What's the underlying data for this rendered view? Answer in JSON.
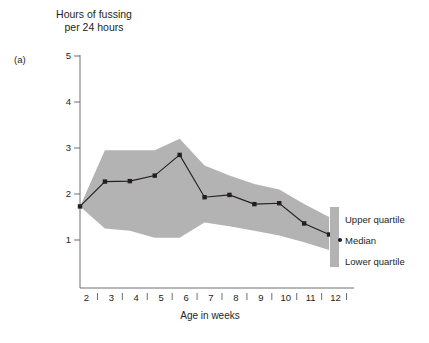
{
  "figure": {
    "panel_label": "(a)",
    "y_axis_title_line1": "Hours of fussing",
    "y_axis_title_line2": "per 24 hours",
    "x_axis_title": "Age in weeks"
  },
  "legend": {
    "upper": "Upper quartile",
    "median": "Median",
    "lower": "Lower quartile"
  },
  "style": {
    "band_fill": "#b3b3b3",
    "line_color": "#231f20",
    "axis_color": "#6d6e71",
    "text_color": "#231f20"
  },
  "chart_data": {
    "type": "line",
    "xlabel": "Age in weeks",
    "ylabel": "Hours of fussing per 24 hours",
    "xlim": [
      2,
      12
    ],
    "ylim": [
      0.45,
      5.3
    ],
    "grid": false,
    "legend_position": "right",
    "x": [
      2,
      3,
      4,
      5,
      6,
      7,
      8,
      9,
      10,
      11,
      12
    ],
    "x_tick_labels": [
      "2",
      "3",
      "4",
      "5",
      "6",
      "7",
      "8",
      "9",
      "10",
      "11",
      "12"
    ],
    "y_ticks": [
      1,
      2,
      3,
      4,
      5
    ],
    "y_tick_labels": [
      "1",
      "2",
      "3",
      "4",
      "5"
    ],
    "series": [
      {
        "name": "Median",
        "values": [
          1.73,
          2.27,
          2.28,
          2.4,
          2.85,
          1.93,
          1.98,
          1.78,
          1.8,
          1.36,
          1.12
        ]
      },
      {
        "name": "Upper quartile",
        "values": [
          1.73,
          2.95,
          2.95,
          2.95,
          3.2,
          2.62,
          2.4,
          2.22,
          2.1,
          1.78,
          1.5
        ]
      },
      {
        "name": "Lower quartile",
        "values": [
          1.73,
          1.25,
          1.2,
          1.05,
          1.05,
          1.38,
          1.3,
          1.2,
          1.1,
          0.95,
          0.78
        ]
      }
    ]
  }
}
